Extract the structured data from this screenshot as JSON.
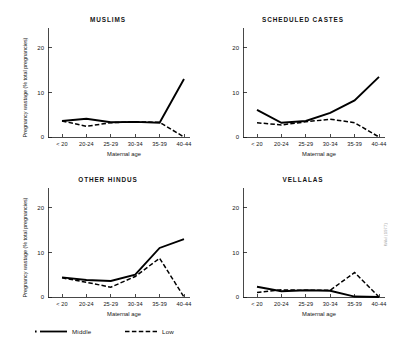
{
  "figure": {
    "xlabel": "Maternal age",
    "ylabel": "Pregnancy wastage (% total pregnancies)",
    "side_note": "Wild (1977)"
  },
  "legend": {
    "position": "bottom-left",
    "items": [
      {
        "label": "Middle",
        "style": "solid"
      },
      {
        "label": "Low",
        "style": "dashed"
      }
    ]
  },
  "chart_data": [
    {
      "type": "line",
      "title": "MUSLIMS",
      "xlabel": "Maternal age",
      "ylabel": "Pregnancy wastage (% total pregnancies)",
      "categories": [
        "< 20",
        "20-24",
        "25-29",
        "30-34",
        "35-39",
        "40-44"
      ],
      "ylim": [
        0,
        24
      ],
      "yticks": [
        0,
        10,
        20
      ],
      "grid": false,
      "legend_position": "bottom-left",
      "series": [
        {
          "name": "Middle",
          "style": "solid",
          "values": [
            3.6,
            4.1,
            3.3,
            3.4,
            3.2,
            13.0
          ]
        },
        {
          "name": "Low",
          "style": "dashed",
          "values": [
            3.6,
            2.4,
            3.2,
            3.4,
            3.3,
            0.0
          ]
        }
      ]
    },
    {
      "type": "line",
      "title": "SCHEDULED CASTES",
      "xlabel": "Maternal age",
      "ylabel": "Pregnancy wastage (% total pregnancies)",
      "categories": [
        "< 20",
        "20-24",
        "25-29",
        "30-34",
        "35-39",
        "40-44"
      ],
      "ylim": [
        0,
        24
      ],
      "yticks": [
        0,
        10,
        20
      ],
      "grid": false,
      "legend_position": "bottom-left",
      "series": [
        {
          "name": "Middle",
          "style": "solid",
          "values": [
            6.1,
            3.2,
            3.6,
            5.4,
            8.2,
            13.5
          ]
        },
        {
          "name": "Low",
          "style": "dashed",
          "values": [
            3.2,
            2.7,
            3.4,
            4.0,
            3.2,
            0.0
          ]
        }
      ]
    },
    {
      "type": "line",
      "title": "OTHER HINDUS",
      "xlabel": "Maternal age",
      "ylabel": "Pregnancy wastage (% total pregnancies)",
      "categories": [
        "< 20",
        "20-24",
        "25-29",
        "30-34",
        "35-39",
        "40-44"
      ],
      "ylim": [
        0,
        24
      ],
      "yticks": [
        0,
        10,
        20
      ],
      "grid": false,
      "legend_position": "bottom-left",
      "series": [
        {
          "name": "Middle",
          "style": "solid",
          "values": [
            4.4,
            3.8,
            3.6,
            5.0,
            11.0,
            13.0
          ]
        },
        {
          "name": "Low",
          "style": "dashed",
          "values": [
            4.3,
            3.3,
            2.2,
            4.6,
            8.7,
            0.0
          ]
        }
      ]
    },
    {
      "type": "line",
      "title": "VELLALAS",
      "xlabel": "Maternal age",
      "ylabel": "Pregnancy wastage (% total pregnancies)",
      "categories": [
        "< 20",
        "20-24",
        "25-29",
        "30-34",
        "35-39",
        "40-44"
      ],
      "ylim": [
        0,
        24
      ],
      "yticks": [
        0,
        10,
        20
      ],
      "grid": false,
      "legend_position": "bottom-left",
      "series": [
        {
          "name": "Middle",
          "style": "solid",
          "values": [
            2.3,
            1.3,
            1.5,
            1.4,
            0.1,
            0.0
          ]
        },
        {
          "name": "Low",
          "style": "dashed",
          "values": [
            1.0,
            1.6,
            1.5,
            1.5,
            5.5,
            0.0
          ]
        }
      ]
    }
  ]
}
